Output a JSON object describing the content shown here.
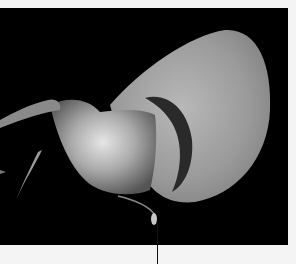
{
  "image": {
    "subject": "flower",
    "style": "grayscale photograph on black background",
    "colors": {
      "background": "#000000",
      "border": "#f4f4f4",
      "leader_line": "#111111"
    }
  },
  "annotations": {
    "leader_line": {
      "label": ""
    }
  }
}
